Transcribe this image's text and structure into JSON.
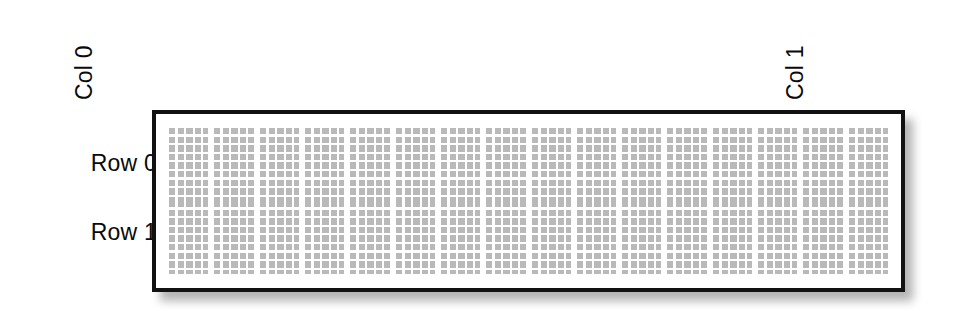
{
  "figure": {
    "type": "microplate-layout-diagram",
    "background_color": "#ffffff",
    "labels": {
      "row_labels": [
        "Row 0",
        "Row 1"
      ],
      "col_labels": [
        "Col 0",
        "Col 1"
      ],
      "col_label_rotation": "90deg-counterclockwise"
    },
    "plate": {
      "border_color": "#111111",
      "border_width_px": 4,
      "fill_color": "#ffffff",
      "shadow": "soft drop shadow lower-right",
      "rows": 2,
      "columns": 16,
      "cell_fill_color": "#b4b4b4",
      "cell_grid_line_color": "#ffffff",
      "cell_subgrid_columns": 5,
      "cell_subgrid_rows": 8
    }
  },
  "chart_data": {
    "type": "heatmap",
    "title": "",
    "xlabel": "",
    "ylabel": "",
    "grid": true,
    "legend": "none",
    "categories_x": [
      "Col 0",
      "Col 1"
    ],
    "categories_y": [
      "Row 0",
      "Row 1"
    ],
    "n_rows": 2,
    "n_cols": 16,
    "note": "Each of the 32 cells is rendered as a uniform light-gray block subdivided by a fine white grid; no per-cell numeric values are printed in the figure."
  }
}
